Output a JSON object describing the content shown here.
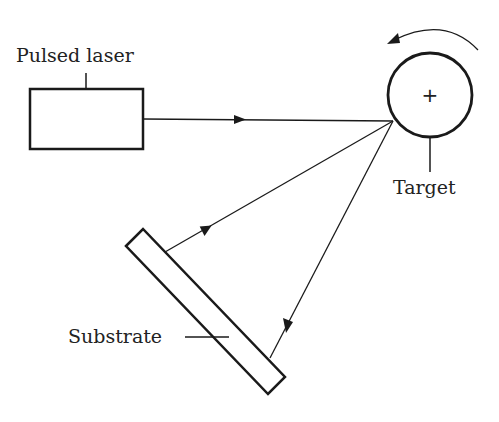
{
  "labels": {
    "laser": "Pulsed laser",
    "target": "Target",
    "substrate": "Substrate"
  },
  "symbols": {
    "target_center": "+"
  },
  "icons": {
    "rotation": "rotation-arrow-icon"
  },
  "colors": {
    "line": "#1a1a1a",
    "background": "#ffffff"
  }
}
